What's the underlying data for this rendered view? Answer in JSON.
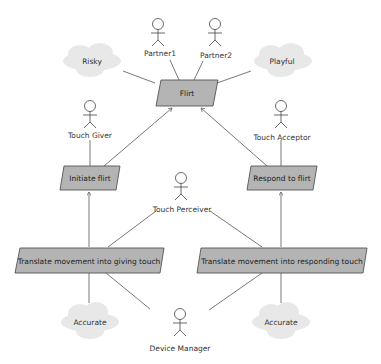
{
  "diagram": {
    "type": "goal-model",
    "colors": {
      "goal_fill": "#b4b4b4",
      "goal_stroke": "#555555",
      "cloud_fill": "#e8e8e8",
      "line": "#555555",
      "text": "#333333"
    },
    "actors": [
      {
        "id": "partner1",
        "label": "Partner1",
        "x": 158,
        "y": 22
      },
      {
        "id": "partner2",
        "label": "Partner2",
        "x": 217,
        "y": 22
      },
      {
        "id": "touch_giver",
        "label": "Touch Giver",
        "x": 90,
        "y": 106
      },
      {
        "id": "touch_acceptor",
        "label": "Touch Acceptor",
        "x": 280,
        "y": 106
      },
      {
        "id": "touch_perceiver",
        "label": "Touch Perceiver",
        "x": 181,
        "y": 178
      },
      {
        "id": "device_manager",
        "label": "Device Manager",
        "x": 180,
        "y": 312
      }
    ],
    "goals": [
      {
        "id": "flirt",
        "label": "Flirt"
      },
      {
        "id": "initiate_flirt",
        "label": "Initiate flirt"
      },
      {
        "id": "respond_flirt",
        "label": "Respond to flirt"
      },
      {
        "id": "translate_giving",
        "label": "Translate movement into giving touch"
      },
      {
        "id": "translate_responding",
        "label": "Translate movement into responding touch"
      }
    ],
    "qualities": [
      {
        "id": "risky",
        "label": "Risky"
      },
      {
        "id": "playful",
        "label": "Playful"
      },
      {
        "id": "accurate_left",
        "label": "Accurate"
      },
      {
        "id": "accurate_right",
        "label": "Accurate"
      }
    ]
  }
}
